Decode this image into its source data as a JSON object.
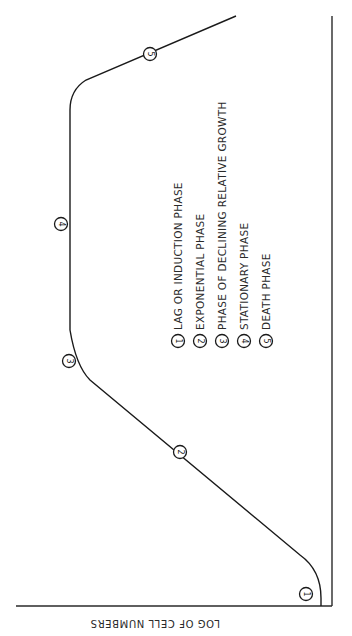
{
  "diagram": {
    "orientation": "rotated 90° (page rotated clockwise)",
    "axis_label": "LOG OF CELL NUMBERS",
    "phases": [
      {
        "id": "1",
        "label": "LAG OR INDUCTION PHASE"
      },
      {
        "id": "2",
        "label": "EXPONENTIAL PHASE"
      },
      {
        "id": "3",
        "label": "PHASE OF DECLINING RELATIVE GROWTH"
      },
      {
        "id": "4",
        "label": "STATIONARY PHASE"
      },
      {
        "id": "5",
        "label": "DEATH PHASE"
      }
    ],
    "colors": {
      "line": "#1a1a1a",
      "background": "#ffffff"
    }
  }
}
